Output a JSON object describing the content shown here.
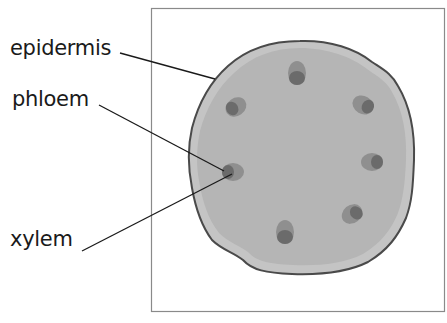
{
  "diagram": {
    "type": "plant stem cross-section",
    "labels": {
      "epidermis": "epidermis",
      "phloem": "phloem",
      "xylem": "xylem"
    },
    "colors": {
      "background": "#ffffff",
      "frame": "#8a8a8a",
      "epidermis_fill": "#c4c4c4",
      "cortex_fill": "#b5b5b5",
      "outline": "#4a4a4a",
      "phloem": "#8f8f8f",
      "xylem": "#6b6b6b",
      "leader_line": "#1a1a1a"
    },
    "vascular_bundles": [
      {
        "name": "top",
        "cx": 297,
        "cy": 73
      },
      {
        "name": "upper-left",
        "cx": 236,
        "cy": 107
      },
      {
        "name": "upper-right",
        "cx": 363,
        "cy": 105
      },
      {
        "name": "left",
        "cx": 233,
        "cy": 172
      },
      {
        "name": "right",
        "cx": 372,
        "cy": 162
      },
      {
        "name": "lower-right",
        "cx": 352,
        "cy": 214
      },
      {
        "name": "bottom",
        "cx": 285,
        "cy": 232
      }
    ]
  }
}
